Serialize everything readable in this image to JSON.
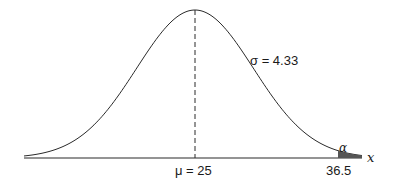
{
  "diagram": {
    "type": "normal-distribution",
    "curve": {
      "mean": 25,
      "sigma": 4.33,
      "x_start": -5,
      "x_end": 36.5,
      "dashed_mean_line": true
    },
    "axis": {
      "label": "x"
    },
    "labels": {
      "mean_label": "μ = 25",
      "sigma_label": "σ = 4.33",
      "tail_label": "α",
      "critical_value": "36.5"
    },
    "colors": {
      "stroke": "#2a2a2a",
      "background": "#ffffff",
      "tail_fill": "#555555"
    }
  }
}
